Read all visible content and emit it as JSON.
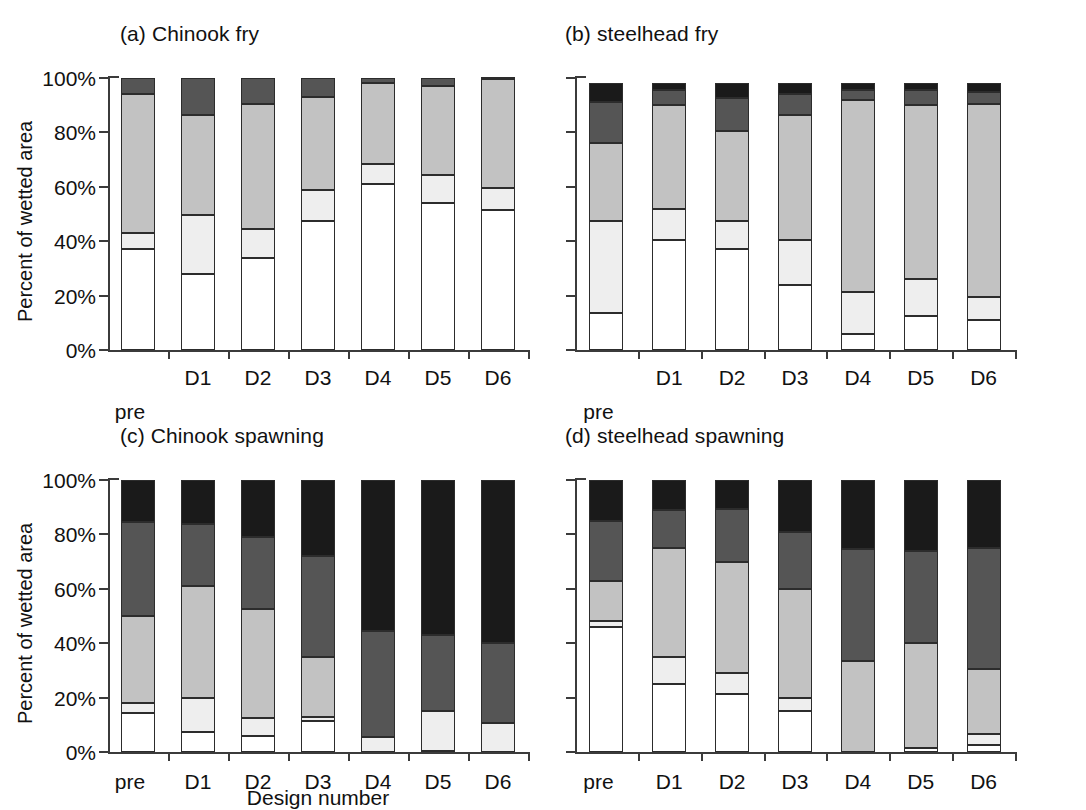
{
  "figure": {
    "y_axis_title": "Percent of wetted area",
    "x_axis_title": "Design number",
    "y_ticks": [
      "0%",
      "20%",
      "40%",
      "60%",
      "80%",
      "100%"
    ],
    "x_categories": [
      "pre",
      "D1",
      "D2",
      "D3",
      "D4",
      "D5",
      "D6"
    ],
    "colors": {
      "white": "#ffffff",
      "light_gray": "#eeeeee",
      "mid_gray": "#c2c2c2",
      "dark_gray": "#555555",
      "black": "#1a1a1a",
      "axis": "#3b3b3b",
      "outline": "#2c2c2c"
    },
    "series_names": [
      "white",
      "light gray",
      "mid gray",
      "dark gray",
      "black"
    ]
  },
  "chart_data": [
    {
      "type": "bar",
      "stacked": true,
      "panel": "a",
      "title": "(a) Chinook fry",
      "xlabel": "Design number",
      "ylabel": "Percent of wetted area",
      "ylim": [
        0,
        100
      ],
      "yticks": [
        0,
        20,
        40,
        60,
        80,
        100
      ],
      "grid": false,
      "legend": "none",
      "categories": [
        "pre",
        "D1",
        "D2",
        "D3",
        "D4",
        "D5",
        "D6"
      ],
      "series": [
        {
          "name": "white",
          "values": [
            37,
            28,
            34,
            47.5,
            61,
            54,
            51.5
          ]
        },
        {
          "name": "light gray",
          "values": [
            6,
            21.5,
            10.5,
            11.5,
            7.5,
            10.5,
            8
          ]
        },
        {
          "name": "mid gray",
          "values": [
            51,
            37,
            46,
            34,
            29.5,
            32.5,
            40
          ]
        },
        {
          "name": "dark gray",
          "values": [
            6,
            13.5,
            9.5,
            7,
            2,
            3,
            0.5
          ]
        }
      ]
    },
    {
      "type": "bar",
      "stacked": true,
      "panel": "b",
      "title": "(b) steelhead fry",
      "xlabel": "Design number",
      "ylabel": "Percent of wetted area",
      "ylim": [
        0,
        100
      ],
      "yticks": [
        0,
        20,
        40,
        60,
        80,
        100
      ],
      "grid": false,
      "legend": "none",
      "categories": [
        "pre",
        "D1",
        "D2",
        "D3",
        "D4",
        "D5",
        "D6"
      ],
      "series": [
        {
          "name": "white",
          "values": [
            13.5,
            40.5,
            37,
            24,
            6,
            12.5,
            11
          ]
        },
        {
          "name": "light gray",
          "values": [
            34,
            11.5,
            10.5,
            16.5,
            15.5,
            13.5,
            8.5
          ]
        },
        {
          "name": "mid gray",
          "values": [
            28.5,
            38,
            33,
            46,
            70.5,
            64,
            71
          ]
        },
        {
          "name": "dark gray",
          "values": [
            15,
            5.5,
            12,
            7.5,
            3.5,
            5.5,
            4.5
          ]
        },
        {
          "name": "black",
          "values": [
            7,
            2.5,
            5.5,
            4,
            2.5,
            2.5,
            3
          ]
        }
      ]
    },
    {
      "type": "bar",
      "stacked": true,
      "panel": "c",
      "title": "(c) Chinook spawning",
      "xlabel": "Design number",
      "ylabel": "Percent of wetted area",
      "ylim": [
        0,
        100
      ],
      "yticks": [
        0,
        20,
        40,
        60,
        80,
        100
      ],
      "grid": false,
      "legend": "none",
      "categories": [
        "pre",
        "D1",
        "D2",
        "D3",
        "D4",
        "D5",
        "D6"
      ],
      "series": [
        {
          "name": "white",
          "values": [
            14.5,
            7.5,
            6,
            11.5,
            0,
            0.5,
            0
          ]
        },
        {
          "name": "light gray",
          "values": [
            3.5,
            12.5,
            6.5,
            1.5,
            5.5,
            14.5,
            10.5
          ]
        },
        {
          "name": "mid gray",
          "values": [
            32,
            41,
            40,
            22,
            0,
            0,
            0
          ]
        },
        {
          "name": "dark gray",
          "values": [
            34.5,
            23,
            26.5,
            37,
            39,
            28,
            29.5
          ]
        },
        {
          "name": "black",
          "values": [
            15.5,
            16,
            21,
            28,
            55.5,
            57,
            60
          ]
        }
      ]
    },
    {
      "type": "bar",
      "stacked": true,
      "panel": "d",
      "title": "(d) steelhead spawning",
      "xlabel": "Design number",
      "ylabel": "Percent of wetted area",
      "ylim": [
        0,
        100
      ],
      "yticks": [
        0,
        20,
        40,
        60,
        80,
        100
      ],
      "grid": false,
      "legend": "none",
      "categories": [
        "pre",
        "D1",
        "D2",
        "D3",
        "D4",
        "D5",
        "D6"
      ],
      "series": [
        {
          "name": "white",
          "values": [
            46,
            25,
            21.5,
            15,
            0,
            1.5,
            2.5
          ]
        },
        {
          "name": "light gray",
          "values": [
            2,
            10,
            7.5,
            5,
            0,
            0,
            4
          ]
        },
        {
          "name": "mid gray",
          "values": [
            15,
            40,
            41,
            40,
            33.5,
            38.5,
            24
          ]
        },
        {
          "name": "dark gray",
          "values": [
            22,
            14,
            19.5,
            21,
            41,
            34,
            44.5
          ]
        },
        {
          "name": "black",
          "values": [
            15,
            11,
            10.5,
            19,
            25.5,
            26,
            25
          ]
        }
      ]
    }
  ]
}
